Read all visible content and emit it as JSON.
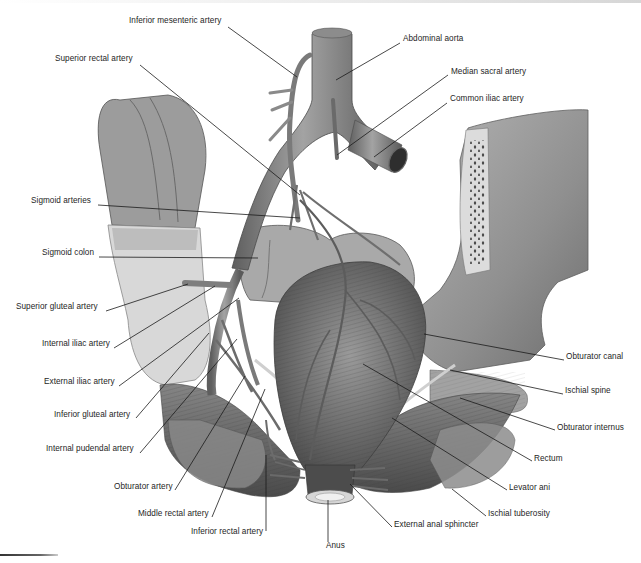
{
  "figure": {
    "width": 641,
    "height": 563,
    "palette": {
      "background": "#ffffff",
      "label_text": "#1e1e1e",
      "leader_line": "#1a1a1a",
      "vessel": "#8a8a8a",
      "vessel_dark": "#5a5a5a",
      "bone": "#9b9b9b",
      "bone_cut": "#d9d9d9",
      "muscle": "#6e6e6e",
      "colon": "#a8a8a8"
    }
  },
  "labels": [
    {
      "id": "inferior-mesenteric-artery",
      "text": "Inferior mesenteric artery",
      "x": 129,
      "y": 20,
      "align": "left",
      "tx": 297,
      "ty": 77,
      "sx": 228,
      "sy": 27
    },
    {
      "id": "abdominal-aorta",
      "text": "Abdominal aorta",
      "x": 403,
      "y": 38,
      "align": "left",
      "tx": 336,
      "ty": 80,
      "sx": 400,
      "sy": 43
    },
    {
      "id": "superior-rectal-artery",
      "text": "Superior rectal artery",
      "x": 55,
      "y": 58,
      "align": "left",
      "tx": 300,
      "ty": 195,
      "sx": 140,
      "sy": 65
    },
    {
      "id": "median-sacral-artery",
      "text": "Median sacral artery",
      "x": 451,
      "y": 71,
      "align": "left",
      "tx": 337,
      "ty": 155,
      "sx": 448,
      "sy": 75
    },
    {
      "id": "common-iliac-artery",
      "text": "Common iliac artery",
      "x": 450,
      "y": 98,
      "align": "left",
      "tx": 374,
      "ty": 157,
      "sx": 447,
      "sy": 103
    },
    {
      "id": "sigmoid-arteries",
      "text": "Sigmoid arteries",
      "x": 31,
      "y": 200,
      "align": "left",
      "tx": 300,
      "ty": 218,
      "sx": 98,
      "sy": 205
    },
    {
      "id": "sigmoid-colon",
      "text": "Sigmoid colon",
      "x": 42,
      "y": 252,
      "align": "left",
      "tx": 258,
      "ty": 258,
      "sx": 99,
      "sy": 257
    },
    {
      "id": "superior-gluteal-artery",
      "text": "Superior gluteal artery",
      "x": 16,
      "y": 306,
      "align": "left",
      "tx": 188,
      "ty": 284,
      "sx": 106,
      "sy": 311
    },
    {
      "id": "internal-iliac-artery",
      "text": "Internal iliac artery",
      "x": 42,
      "y": 343,
      "align": "left",
      "tx": 215,
      "ty": 286,
      "sx": 114,
      "sy": 348
    },
    {
      "id": "external-iliac-artery",
      "text": "External iliac artery",
      "x": 44,
      "y": 381,
      "align": "left",
      "tx": 239,
      "ty": 298,
      "sx": 119,
      "sy": 386
    },
    {
      "id": "inferior-gluteal-artery",
      "text": "Inferior gluteal artery",
      "x": 54,
      "y": 414,
      "align": "left",
      "tx": 209,
      "ty": 333,
      "sx": 136,
      "sy": 418
    },
    {
      "id": "internal-pudendal-artery",
      "text": "Internal pudendal artery",
      "x": 46,
      "y": 448,
      "align": "left",
      "tx": 237,
      "ty": 339,
      "sx": 140,
      "sy": 453
    },
    {
      "id": "obturator-artery",
      "text": "Obturator artery",
      "x": 114,
      "y": 486,
      "align": "left",
      "tx": 245,
      "ty": 376,
      "sx": 175,
      "sy": 490
    },
    {
      "id": "middle-rectal-artery",
      "text": "Middle rectal artery",
      "x": 138,
      "y": 513,
      "align": "left",
      "tx": 265,
      "ty": 389,
      "sx": 212,
      "sy": 517
    },
    {
      "id": "inferior-rectal-artery",
      "text": "Inferior rectal artery",
      "x": 191,
      "y": 531,
      "align": "left",
      "tx": 266,
      "ty": 455,
      "sx": 266,
      "sy": 531
    },
    {
      "id": "anus",
      "text": "Anus",
      "x": 326,
      "y": 545,
      "align": "left",
      "tx": 328,
      "ty": 500,
      "sx": 328,
      "sy": 542
    },
    {
      "id": "external-anal-sphincter",
      "text": "External anal sphincter",
      "x": 394,
      "y": 524,
      "align": "left",
      "tx": 350,
      "ty": 484,
      "sx": 392,
      "sy": 527
    },
    {
      "id": "ischial-tuberosity",
      "text": "Ischial tuberosity",
      "x": 488,
      "y": 513,
      "align": "left",
      "tx": 452,
      "ty": 489,
      "sx": 486,
      "sy": 516
    },
    {
      "id": "levator-ani",
      "text": "Levator ani",
      "x": 509,
      "y": 487,
      "align": "left",
      "tx": 392,
      "ty": 418,
      "sx": 507,
      "sy": 490
    },
    {
      "id": "rectum",
      "text": "Rectum",
      "x": 534,
      "y": 458,
      "align": "left",
      "tx": 363,
      "ty": 364,
      "sx": 532,
      "sy": 461
    },
    {
      "id": "obturator-internus",
      "text": "Obturator internus",
      "x": 557,
      "y": 427,
      "align": "left",
      "tx": 460,
      "ty": 398,
      "sx": 555,
      "sy": 430
    },
    {
      "id": "ischial-spine",
      "text": "Ischial spine",
      "x": 565,
      "y": 390,
      "align": "left",
      "tx": 450,
      "ty": 370,
      "sx": 563,
      "sy": 394
    },
    {
      "id": "obturator-canal",
      "text": "Obturator canal",
      "x": 566,
      "y": 356,
      "align": "left",
      "tx": 424,
      "ty": 334,
      "sx": 564,
      "sy": 360
    }
  ]
}
